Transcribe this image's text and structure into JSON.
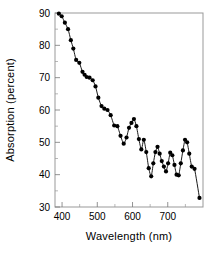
{
  "chart_data": {
    "type": "line",
    "title": "",
    "xlabel": "Wavelength (nm)",
    "ylabel": "Absorption (percent)",
    "xlim": [
      380,
      800
    ],
    "ylim": [
      30,
      90
    ],
    "xticks": [
      400,
      500,
      600,
      700
    ],
    "yticks": [
      30,
      40,
      50,
      60,
      70,
      80,
      90
    ],
    "xtick_labels": [
      "400",
      "500",
      "600",
      "700"
    ],
    "ytick_labels": [
      "30",
      "40",
      "50",
      "60",
      "70",
      "80",
      "90"
    ],
    "minor_xticks": [
      450,
      550,
      650,
      750
    ],
    "minor_yticks": [
      35,
      45,
      55,
      65,
      75,
      85
    ],
    "grid": false,
    "legend": null,
    "marker": "filled-circle",
    "marker_color": "#000000",
    "line_color": "#000000",
    "series": [
      {
        "name": "Absorption spectrum",
        "x": [
          391,
          399,
          408,
          417,
          425,
          432,
          440,
          449,
          458,
          464,
          470,
          478,
          487,
          495,
          503,
          512,
          520,
          529,
          538,
          548,
          557,
          566,
          575,
          583,
          590,
          597,
          604,
          611,
          618,
          625,
          632,
          639,
          646,
          653,
          659,
          665,
          671,
          677,
          683,
          689,
          695,
          701,
          707,
          713,
          719,
          725,
          731,
          737,
          743,
          749,
          755,
          761,
          768,
          776,
          790
        ],
        "y": [
          89.8,
          89.0,
          87.0,
          85.0,
          81.6,
          79.0,
          75.5,
          74.6,
          71.8,
          70.9,
          70.2,
          70.0,
          69.2,
          67.3,
          63.8,
          61.2,
          60.4,
          60.0,
          58.4,
          55.2,
          55.0,
          52.0,
          49.6,
          51.5,
          54.5,
          56.0,
          57.2,
          55.0,
          51.0,
          47.8,
          50.8,
          47.0,
          42.0,
          39.5,
          43.5,
          47.0,
          48.6,
          46.5,
          44.2,
          42.5,
          41.0,
          43.5,
          46.8,
          46.0,
          43.0,
          40.0,
          39.8,
          43.5,
          47.5,
          50.8,
          50.0,
          46.5,
          42.5,
          41.8,
          32.8
        ]
      }
    ]
  },
  "axes": {
    "y_label_text": "Absorption (percent)",
    "x_label_text": "Wavelength (nm)"
  }
}
